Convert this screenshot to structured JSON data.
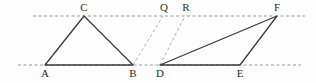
{
  "figure": {
    "background_color": "#fdfdfd",
    "stroke_color": "#3a3a3a",
    "dash_color": "#9a9a9a",
    "label_color": "#2b2b2b",
    "width": 316,
    "height": 83
  },
  "guides": {
    "top_line": {
      "name": "top-parallel-line",
      "x1": 33,
      "y1": 16,
      "x2": 305,
      "y2": 16,
      "style": "dashed"
    },
    "bottom_line": {
      "name": "bottom-parallel-line",
      "x1": 18,
      "y1": 65,
      "x2": 301,
      "y2": 65,
      "style": "dashed"
    }
  },
  "points": {
    "A": {
      "label": "A",
      "x": 45,
      "y": 65,
      "label_x": 45,
      "label_y": 68
    },
    "B": {
      "label": "B",
      "x": 133,
      "y": 65,
      "label_x": 133,
      "label_y": 68
    },
    "C": {
      "label": "C",
      "x": 84,
      "y": 16,
      "label_x": 84,
      "label_y": 2
    },
    "D": {
      "label": "D",
      "x": 160,
      "y": 65,
      "label_x": 160,
      "label_y": 68
    },
    "E": {
      "label": "E",
      "x": 240,
      "y": 65,
      "label_x": 240,
      "label_y": 68
    },
    "F": {
      "label": "F",
      "x": 277,
      "y": 16,
      "label_x": 277,
      "label_y": 2
    },
    "Q": {
      "label": "Q",
      "x": 163,
      "y": 16,
      "label_x": 164,
      "label_y": 2
    },
    "R": {
      "label": "R",
      "x": 185,
      "y": 16,
      "label_x": 186,
      "label_y": 2
    }
  },
  "shapes": {
    "triangle_abc": {
      "name": "triangle-abc",
      "vertices": "45,65 84,16 133,65",
      "style": "solid"
    },
    "triangle_def": {
      "name": "triangle-def",
      "vertices": "160,65 277,16 240,65",
      "style": "solid"
    }
  },
  "construction_lines": [
    {
      "name": "dashed-line-b-q",
      "x1": 133,
      "y1": 65,
      "x2": 163,
      "y2": 16,
      "style": "dashed"
    },
    {
      "name": "dashed-line-d-r",
      "x1": 160,
      "y1": 65,
      "x2": 185,
      "y2": 16,
      "style": "dashed"
    }
  ]
}
